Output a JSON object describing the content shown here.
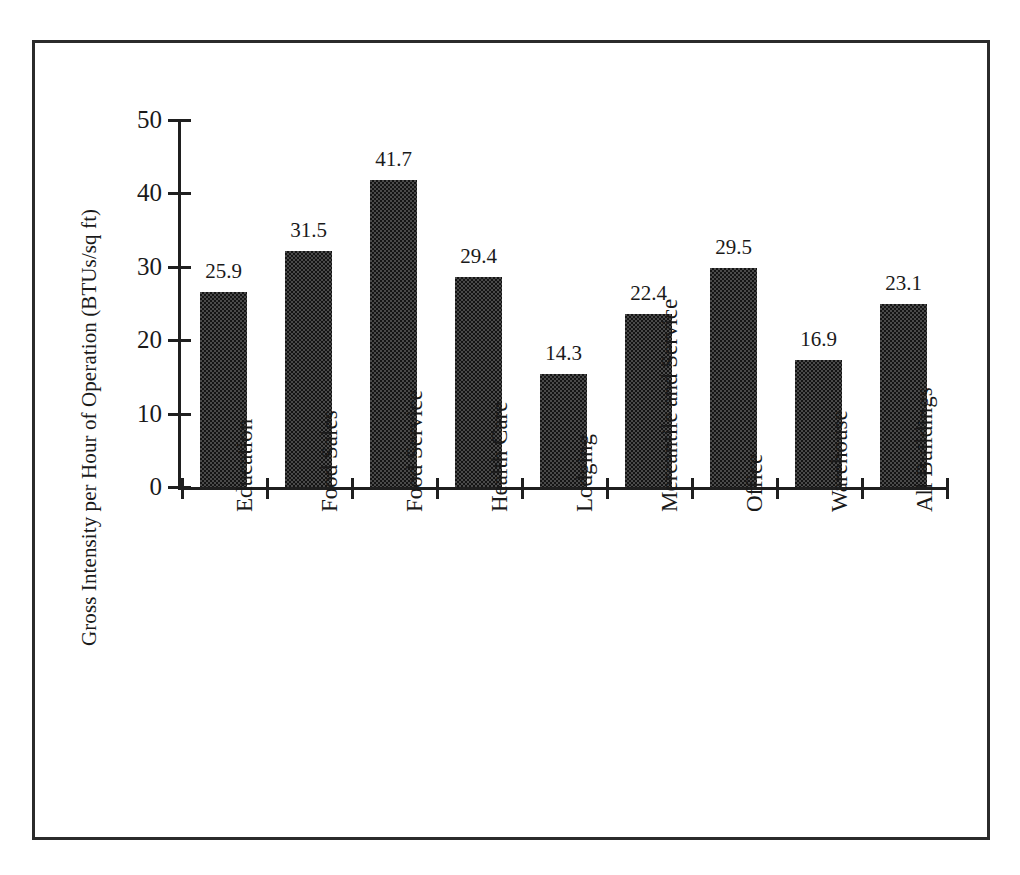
{
  "chart_data": {
    "type": "bar",
    "title": "",
    "xlabel": "",
    "ylabel": "Gross Intensity per Hour of Operation (BTUs/sq ft)",
    "ylim": [
      0,
      50
    ],
    "ytick_labels": [
      "50",
      "40",
      "30",
      "20",
      "10",
      "0"
    ],
    "ytick_values": [
      50,
      40,
      30,
      20,
      10,
      0
    ],
    "grid": false,
    "legend": null,
    "categories": [
      "Education",
      "Food Sales",
      "Food Service",
      "Health Care",
      "Lodging",
      "Mercantile and Service",
      "Office",
      "Warehouse",
      "All Buildings"
    ],
    "values": [
      25.9,
      31.5,
      41.7,
      29.4,
      14.3,
      22.4,
      29.5,
      16.9,
      23.1
    ],
    "bar_labels": [
      "25.9",
      "31.5",
      "41.7",
      "29.4",
      "14.3",
      "22.4",
      "29.5",
      "16.9",
      "23.1"
    ],
    "bar_heights_plotted": [
      26.5,
      32.1,
      41.8,
      28.6,
      15.4,
      23.6,
      29.9,
      17.3,
      24.9
    ],
    "bar_fill": "#3f3f3f",
    "bar_pattern": "checkerboard-dither",
    "axis_color": "#1f1f1f",
    "background": "#ffffff",
    "frame_color": "#2b2b2b"
  }
}
